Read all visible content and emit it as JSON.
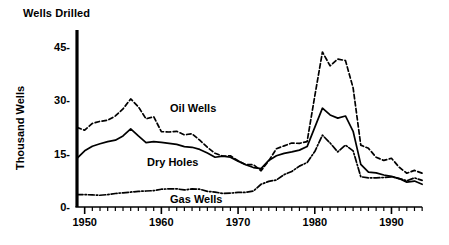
{
  "chart_data": {
    "type": "line",
    "title": "Wells Drilled",
    "xlabel": "",
    "ylabel": "Thousand Wells",
    "xlim": [
      1949,
      1994
    ],
    "ylim": [
      0,
      48
    ],
    "yticks": [
      0,
      15,
      30,
      45
    ],
    "ytick_labels": [
      "0-",
      "15-",
      "30-",
      "45-"
    ],
    "xticks": [
      1950,
      1960,
      1970,
      1980,
      1990
    ],
    "xtick_labels": [
      "1950",
      "1960",
      "1970",
      "1980",
      "1990"
    ],
    "minor_tick_interval": 1,
    "grid": false,
    "legend_position": "inline-annotations",
    "x": [
      1949,
      1950,
      1951,
      1952,
      1953,
      1954,
      1955,
      1956,
      1957,
      1958,
      1959,
      1960,
      1961,
      1962,
      1963,
      1964,
      1965,
      1966,
      1967,
      1968,
      1969,
      1970,
      1971,
      1972,
      1973,
      1974,
      1975,
      1976,
      1977,
      1978,
      1979,
      1980,
      1981,
      1982,
      1983,
      1984,
      1985,
      1986,
      1987,
      1988,
      1989,
      1990,
      1991,
      1992,
      1993,
      1994
    ],
    "series": [
      {
        "name": "Oil Wells",
        "style": "dashed",
        "color": "#000000",
        "label_x": 1961,
        "label_y": 27.5,
        "values": [
          22.4,
          21.6,
          23.5,
          24.1,
          24.4,
          25.6,
          27.6,
          30.4,
          28.2,
          24.8,
          25.4,
          21.2,
          21.1,
          21.3,
          20.3,
          20.6,
          18.8,
          16.8,
          15.1,
          14.3,
          14.4,
          13.0,
          11.9,
          11.9,
          10.2,
          13.0,
          16.4,
          17.2,
          18.0,
          17.9,
          18.4,
          31.2,
          43.6,
          39.7,
          41.6,
          41.2,
          33.5,
          17.4,
          16.5,
          14.0,
          13.1,
          13.7,
          11.2,
          9.5,
          10.3,
          9.5
        ]
      },
      {
        "name": "Dry Holes",
        "style": "solid",
        "color": "#000000",
        "label_x": 1958,
        "label_y": 12.5,
        "values": [
          13.7,
          15.8,
          17.1,
          17.8,
          18.4,
          18.8,
          20.0,
          22.0,
          20.0,
          18.1,
          18.4,
          18.2,
          17.9,
          17.6,
          17.0,
          16.8,
          16.2,
          15.2,
          14.0,
          14.3,
          14.0,
          12.9,
          11.9,
          11.1,
          10.8,
          13.1,
          14.4,
          15.1,
          15.5,
          16.0,
          17.0,
          22.4,
          27.8,
          25.9,
          25.0,
          25.6,
          21.3,
          12.0,
          9.8,
          9.6,
          9.0,
          8.6,
          8.0,
          7.0,
          7.3,
          6.4
        ]
      },
      {
        "name": "Gas Wells",
        "style": "dashdot",
        "color": "#000000",
        "label_x": 1961,
        "label_y": 2.0,
        "values": [
          3.5,
          3.5,
          3.4,
          3.3,
          3.5,
          3.8,
          4.0,
          4.2,
          4.4,
          4.5,
          4.6,
          5.0,
          5.1,
          5.1,
          4.8,
          5.1,
          5.0,
          4.4,
          4.2,
          3.8,
          3.9,
          4.1,
          4.1,
          4.5,
          6.4,
          7.2,
          7.6,
          9.1,
          10.0,
          11.5,
          12.5,
          15.6,
          20.2,
          18.0,
          15.5,
          17.4,
          15.8,
          8.5,
          8.2,
          8.2,
          8.3,
          8.5,
          8.0,
          7.4,
          8.2,
          7.5
        ]
      }
    ]
  }
}
